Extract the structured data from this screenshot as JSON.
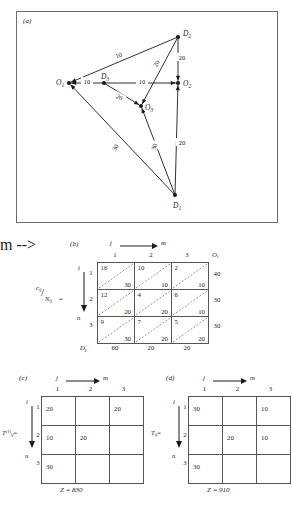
{
  "figure": {
    "panel_a_label": "(a)",
    "panel_b_label": "(b)",
    "panel_c_label": "(c)",
    "panel_d_label": "(d)"
  },
  "network": {
    "nodes": [
      {
        "id": "O1",
        "label": "O",
        "subscript": "1",
        "x": 69,
        "y": 83,
        "label_dx": -13,
        "label_dy": 2
      },
      {
        "id": "D3",
        "label": "D",
        "subscript": "3",
        "x": 104,
        "y": 83,
        "label_dx": -3,
        "label_dy": -4
      },
      {
        "id": "O3",
        "label": "O",
        "subscript": "3",
        "x": 141,
        "y": 106,
        "label_dx": 4,
        "label_dy": 4
      },
      {
        "id": "O2",
        "label": "O",
        "subscript": "2",
        "x": 178,
        "y": 83,
        "label_dx": 5,
        "label_dy": 3
      },
      {
        "id": "D2",
        "label": "D",
        "subscript": "2",
        "x": 178,
        "y": 37,
        "label_dx": 5,
        "label_dy": -1
      },
      {
        "id": "D1",
        "label": "D",
        "subscript": "1",
        "x": 175,
        "y": 195,
        "label_dx": -2,
        "label_dy": 13
      }
    ],
    "edges": [
      {
        "from": "D3",
        "to": "O1",
        "cost": "10",
        "lx": 87,
        "ly": 82,
        "rot": 0
      },
      {
        "from": "D2",
        "to": "O1",
        "cost": "10",
        "lx": 119,
        "ly": 56,
        "rot": -22
      },
      {
        "from": "D3",
        "to": "O2",
        "cost": "10",
        "lx": 142,
        "ly": 82,
        "rot": 0
      },
      {
        "from": "D3",
        "to": "O3",
        "cost": "20",
        "lx": 119,
        "ly": 98,
        "rot": 28
      },
      {
        "from": "D2",
        "to": "O3",
        "cost": "20",
        "lx": 157,
        "ly": 64,
        "rot": -62
      },
      {
        "from": "D2",
        "to": "O2",
        "cost": "20",
        "lx": 182,
        "ly": 58,
        "rot": 0
      },
      {
        "from": "D1",
        "to": "O2",
        "cost": "20",
        "lx": 182,
        "ly": 143,
        "rot": 0
      },
      {
        "from": "D1",
        "to": "O1",
        "cost": "30",
        "lx": 116,
        "ly": 148,
        "rot": -60
      },
      {
        "from": "D1",
        "to": "O3",
        "cost": "30",
        "lx": 155,
        "ly": 147,
        "rot": -74
      }
    ]
  },
  "table_b": {
    "left_label": {
      "num": "c",
      "num_sub": "ij",
      "den": "N",
      "den_sub": "ij",
      "eq": "="
    },
    "col_axis_from": "j",
    "col_axis_to": "m",
    "row_axis_from": "i",
    "row_axis_to": "n",
    "col_headers": [
      "1",
      "2",
      "3"
    ],
    "row_headers": [
      "1",
      "2",
      "3"
    ],
    "supply_header": "O",
    "supply_header_sub": "i",
    "demand_header": "D",
    "demand_header_sub": "j",
    "costs": [
      [
        "16",
        "10",
        "2"
      ],
      [
        "12",
        "4",
        "6"
      ],
      [
        "9",
        "7",
        "5"
      ]
    ],
    "capacities": [
      [
        "30",
        "10",
        "10"
      ],
      [
        "20",
        "20",
        "10"
      ],
      [
        "30",
        "20",
        "20"
      ]
    ],
    "supplies": [
      "40",
      "30",
      "30"
    ],
    "demands": [
      "60",
      "20",
      "20"
    ]
  },
  "table_c": {
    "left_label": {
      "base": "T",
      "sub": "ij",
      "sup": "(1)",
      "eq": "="
    },
    "col_axis_from": "j",
    "col_axis_to": "m",
    "row_axis_from": "i",
    "row_axis_to": "n",
    "col_headers": [
      "1",
      "2",
      "3"
    ],
    "row_headers": [
      "1",
      "2",
      "3"
    ],
    "values": [
      [
        "20",
        "",
        "20"
      ],
      [
        "10",
        "20",
        ""
      ],
      [
        "30",
        "",
        ""
      ]
    ],
    "objective_label": "Z",
    "objective_value": "830",
    "objective_text": "Z = 830"
  },
  "table_d": {
    "left_label": {
      "base": "T",
      "sub": "ij",
      "sup": "",
      "eq": "="
    },
    "col_axis_from": "j",
    "col_axis_to": "m",
    "row_axis_from": "i",
    "row_axis_to": "n",
    "col_headers": [
      "1",
      "2",
      "3"
    ],
    "row_headers": [
      "1",
      "2",
      "3"
    ],
    "values": [
      [
        "30",
        "",
        "10"
      ],
      [
        "",
        "20",
        "10"
      ],
      [
        "30",
        "",
        ""
      ]
    ],
    "objective_label": "Z",
    "objective_value": "910",
    "objective_text": "Z = 910"
  }
}
